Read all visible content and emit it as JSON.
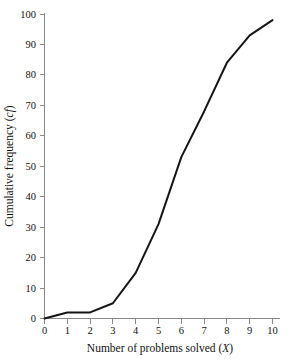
{
  "chart_data": {
    "type": "line",
    "title": "",
    "subtitle": "",
    "xlabel": "Number of problems solved (X)",
    "xlabel_main": "Number of problems solved (",
    "xlabel_var": "X",
    "xlabel_tail": ")",
    "ylabel": "Cumulative frequency (cf)",
    "ylabel_main": "Cumulative frequency (",
    "ylabel_var": "cf",
    "ylabel_tail": ")",
    "x": [
      0,
      1,
      2,
      3,
      4,
      5,
      6,
      7,
      8,
      9,
      10
    ],
    "values": [
      0,
      2,
      2,
      5,
      15,
      31,
      53,
      68,
      84,
      93,
      98
    ],
    "series": [
      {
        "name": "Cumulative frequency",
        "values": [
          0,
          2,
          2,
          5,
          15,
          31,
          53,
          68,
          84,
          93,
          98
        ]
      }
    ],
    "xlim": [
      0,
      10
    ],
    "ylim": [
      0,
      100
    ],
    "xticks": [
      0,
      1,
      2,
      3,
      4,
      5,
      6,
      7,
      8,
      9,
      10
    ],
    "xtick_labels": [
      "0",
      "1",
      "2",
      "3",
      "4",
      "5",
      "6",
      "7",
      "8",
      "9",
      "10"
    ],
    "yticks": [
      0,
      10,
      20,
      30,
      40,
      50,
      60,
      70,
      80,
      90,
      100
    ],
    "ytick_labels": [
      "0",
      "10",
      "20",
      "30",
      "40",
      "50",
      "60",
      "70",
      "80",
      "90",
      "100"
    ],
    "grid": false,
    "legend": false,
    "legend_position": "none",
    "line_color": "#151515",
    "axis_color": "#8a8a8a",
    "background_color": "#ffffff",
    "annotations": []
  },
  "axes": {
    "x_tick_0": "0",
    "x_tick_1": "1",
    "x_tick_2": "2",
    "x_tick_3": "3",
    "x_tick_4": "4",
    "x_tick_5": "5",
    "x_tick_6": "6",
    "x_tick_7": "7",
    "x_tick_8": "8",
    "x_tick_9": "9",
    "x_tick_10": "10",
    "y_tick_0": "0",
    "y_tick_10": "10",
    "y_tick_20": "20",
    "y_tick_30": "30",
    "y_tick_40": "40",
    "y_tick_50": "50",
    "y_tick_60": "60",
    "y_tick_70": "70",
    "y_tick_80": "80",
    "y_tick_90": "90",
    "y_tick_100": "100"
  }
}
